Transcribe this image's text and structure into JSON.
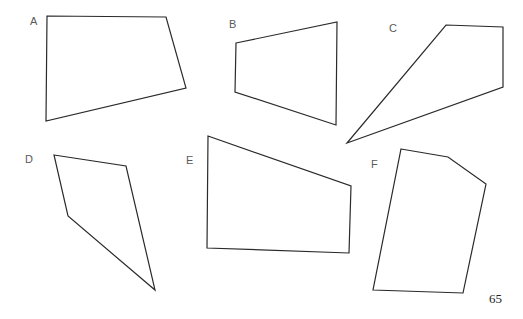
{
  "page": {
    "page_number": "65",
    "stroke_color": "#2a2a2a",
    "label_color": "#5a5a5a"
  },
  "shapes": [
    {
      "label": "A",
      "label_pos": [
        30,
        16
      ],
      "points": "47,16 166,17 186,88 46,121"
    },
    {
      "label": "B",
      "label_pos": [
        229,
        19
      ],
      "points": "236,43 337,22 336,125 235,92"
    },
    {
      "label": "C",
      "label_pos": [
        389,
        23
      ],
      "points": "446,25 503,27 503,87 347,143"
    },
    {
      "label": "D",
      "label_pos": [
        25,
        154
      ],
      "points": "54,155 126,166 155,290 68,216"
    },
    {
      "label": "E",
      "label_pos": [
        186,
        155
      ],
      "points": "208,136 351,186 349,253 207,248"
    },
    {
      "label": "F",
      "label_pos": [
        371,
        159
      ],
      "points": "401,149 448,157 486,184 463,293 373,290"
    }
  ]
}
